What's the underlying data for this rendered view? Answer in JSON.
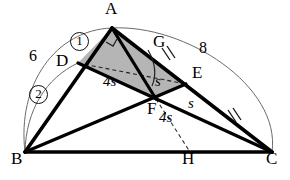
{
  "figure": {
    "type": "euclidean-geometry-diagram",
    "title": "",
    "background_color": "#ffffff",
    "stroke_color": "#000000",
    "thin_stroke_color": "#555555",
    "shaded_fill": "#b3b3b3",
    "width": 290,
    "height": 180
  },
  "points": {
    "A": {
      "label": "A",
      "x": 112,
      "y": 28
    },
    "B": {
      "label": "B",
      "x": 25,
      "y": 152
    },
    "C": {
      "label": "C",
      "x": 272,
      "y": 152
    },
    "D": {
      "label": "D",
      "x": 78,
      "y": 63
    },
    "E": {
      "label": "E",
      "x": 186,
      "y": 84
    },
    "F": {
      "label": "F",
      "x": 156,
      "y": 99
    },
    "G": {
      "label": "G",
      "x": 162,
      "y": 48
    },
    "H": {
      "label": "H",
      "x": 190,
      "y": 152
    }
  },
  "point_labels": [
    {
      "name": "point-label-a",
      "text": "A",
      "x": 105,
      "y": 2
    },
    {
      "name": "point-label-b",
      "text": "B",
      "x": 12,
      "y": 154
    },
    {
      "name": "point-label-c",
      "text": "C",
      "x": 268,
      "y": 154
    },
    {
      "name": "point-label-d",
      "text": "D",
      "x": 58,
      "y": 56
    },
    {
      "name": "point-label-e",
      "text": "E",
      "x": 193,
      "y": 70
    },
    {
      "name": "point-label-f",
      "text": "F",
      "x": 150,
      "y": 105
    },
    {
      "name": "point-label-g",
      "text": "G",
      "x": 156,
      "y": 38
    },
    {
      "name": "point-label-h",
      "text": "H",
      "x": 184,
      "y": 154
    }
  ],
  "measure_labels": [
    {
      "name": "arc-length-label-6",
      "text": "6",
      "x": 31,
      "y": 52
    },
    {
      "name": "arc-length-label-8",
      "text": "8",
      "x": 202,
      "y": 44
    },
    {
      "name": "segment-label-4s-de",
      "text": "4s",
      "x": 106,
      "y": 78
    },
    {
      "name": "segment-label-s-fe",
      "text": "s",
      "x": 157,
      "y": 78
    },
    {
      "name": "segment-label-s-ec",
      "text": "s",
      "x": 190,
      "y": 100
    },
    {
      "name": "segment-label-4s-fh",
      "text": "4s",
      "x": 162,
      "y": 112
    }
  ],
  "circled_labels": [
    {
      "name": "circled-label-1",
      "text": "1",
      "x": 75,
      "y": 38
    },
    {
      "name": "circled-label-2",
      "text": "2",
      "x": 34,
      "y": 90
    }
  ],
  "segments": [
    {
      "name": "segment-ab",
      "from": "A",
      "to": "B",
      "style": "thick-solid"
    },
    {
      "name": "segment-bc",
      "from": "B",
      "to": "C",
      "style": "thick-solid"
    },
    {
      "name": "segment-ac",
      "from": "A",
      "to": "C",
      "style": "thick-solid"
    },
    {
      "name": "segment-dc",
      "from": "D",
      "to": "C",
      "style": "thick-solid"
    },
    {
      "name": "segment-be",
      "from": "B",
      "to": "E",
      "style": "thick-solid"
    },
    {
      "name": "segment-af",
      "from": "A",
      "to": "F",
      "style": "thick-solid"
    },
    {
      "name": "segment-de",
      "from": "D",
      "to": "E",
      "style": "dashed"
    },
    {
      "name": "segment-fh",
      "from": "F",
      "to": "H",
      "style": "dashed"
    }
  ],
  "arcs": [
    {
      "name": "arc-b-to-a",
      "label": "6",
      "from": "B",
      "to": "A",
      "style": "thin"
    },
    {
      "name": "arc-b-to-d",
      "label": "2",
      "from": "B",
      "to": "D",
      "style": "thin"
    },
    {
      "name": "arc-c-to-a",
      "label": "8",
      "from": "C",
      "to": "A",
      "style": "thin"
    }
  ],
  "tick_marks": [
    {
      "name": "tick-mark-ag",
      "on": "segment-ag",
      "count": 2
    },
    {
      "name": "tick-mark-ec",
      "on": "segment-ec",
      "count": 2
    }
  ],
  "angle_marks": [
    {
      "name": "right-angle-mark-at-a",
      "at": "A",
      "type": "right-angle"
    },
    {
      "name": "angle-arc-at-g",
      "at": "G",
      "type": "arc"
    }
  ],
  "shaded_region": {
    "name": "shaded-quadrilateral-adfe",
    "vertices": [
      "A",
      "D",
      "F",
      "E"
    ],
    "fill": "#b3b3b3"
  }
}
